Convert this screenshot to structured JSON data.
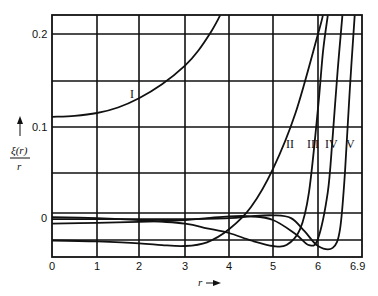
{
  "chart_data": {
    "type": "line",
    "title": "",
    "xlabel": "r",
    "ylabel": "ξ(r)/r",
    "xlim": [
      0,
      6.9
    ],
    "ylim": [
      -0.04,
      0.22
    ],
    "grid": true,
    "x_ticks": [
      "0",
      "1",
      "2",
      "3",
      "4",
      "5",
      "6",
      "6.9"
    ],
    "y_ticks": [
      "0.2",
      "0.1",
      "0"
    ],
    "series": [
      {
        "name": "I",
        "x": [
          0,
          0.5,
          1,
          1.5,
          2,
          2.5,
          3,
          3.3,
          3.6,
          3.8
        ],
        "y": [
          0.111,
          0.112,
          0.115,
          0.121,
          0.131,
          0.146,
          0.166,
          0.182,
          0.203,
          0.22
        ]
      },
      {
        "name": "II",
        "x": [
          0,
          1,
          2,
          2.5,
          3,
          3.5,
          4,
          4.5,
          5,
          5.5,
          6,
          6.1
        ],
        "y": [
          -0.022,
          -0.023,
          -0.025,
          -0.027,
          -0.028,
          -0.024,
          -0.01,
          0.014,
          0.055,
          0.115,
          0.2,
          0.22
        ]
      },
      {
        "name": "III",
        "x": [
          0,
          1,
          2,
          3,
          3.5,
          4,
          4.5,
          5,
          5.3,
          5.6,
          5.8,
          6,
          6.1,
          6.2
        ],
        "y": [
          0.003,
          0.002,
          0.0,
          -0.004,
          -0.009,
          -0.014,
          -0.022,
          -0.028,
          -0.027,
          -0.01,
          0.03,
          0.12,
          0.18,
          0.22
        ]
      },
      {
        "name": "IV",
        "x": [
          0,
          1,
          2,
          3,
          3.5,
          4,
          4.5,
          5,
          5.5,
          5.8,
          6,
          6.2,
          6.3,
          6.4,
          6.5
        ],
        "y": [
          -0.004,
          -0.003,
          -0.002,
          0.0,
          0.002,
          0.004,
          0.004,
          0.0,
          -0.015,
          -0.027,
          -0.02,
          0.03,
          0.09,
          0.16,
          0.22
        ]
      },
      {
        "name": "V",
        "x": [
          0,
          1,
          2,
          3,
          4,
          4.5,
          5,
          5.4,
          5.7,
          6,
          6.3,
          6.45,
          6.55,
          6.65,
          6.75
        ],
        "y": [
          0.001,
          0.001,
          0.001,
          0.001,
          0.002,
          0.004,
          0.005,
          0.002,
          -0.012,
          -0.028,
          -0.03,
          -0.01,
          0.05,
          0.14,
          0.22
        ]
      }
    ]
  },
  "labels": {
    "y_axis_label_top": "ξ(r)",
    "y_axis_label_bottom": "r",
    "x_axis_label": "r",
    "curve_I": "I",
    "curve_II": "II",
    "curve_III": "III",
    "curve_IV": "IV",
    "curve_V": "V",
    "tick_x0": "0",
    "tick_x1": "1",
    "tick_x2": "2",
    "tick_x3": "3",
    "tick_x4": "4",
    "tick_x5": "5",
    "tick_x6": "6",
    "tick_x69": "6.9",
    "tick_y02": "0.2",
    "tick_y01": "0.1",
    "tick_y0": "0"
  }
}
